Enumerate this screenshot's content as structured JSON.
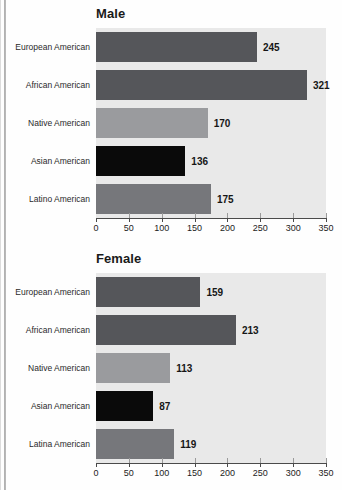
{
  "colors": {
    "dark_gray": "#55565a",
    "medium_gray": "#76777b",
    "light_gray": "#9a9b9e",
    "black": "#0a0a0a",
    "plot_background": "#e9e9e9",
    "axis": "#4a4a4a"
  },
  "chart_data": [
    {
      "type": "bar",
      "orientation": "horizontal",
      "title": "Male",
      "xlabel": "",
      "ylabel": "",
      "xlim": [
        0,
        350
      ],
      "xticks": [
        0,
        50,
        100,
        150,
        200,
        250,
        300,
        350
      ],
      "grid": false,
      "legend": "none",
      "categories": [
        "European American",
        "African American",
        "Native American",
        "Asian American",
        "Latino American"
      ],
      "values": [
        245,
        321,
        170,
        136,
        175
      ],
      "bar_colors": [
        "#55565a",
        "#55565a",
        "#9a9b9e",
        "#0a0a0a",
        "#76777b"
      ]
    },
    {
      "type": "bar",
      "orientation": "horizontal",
      "title": "Female",
      "xlabel": "",
      "ylabel": "",
      "xlim": [
        0,
        350
      ],
      "xticks": [
        0,
        50,
        100,
        150,
        200,
        250,
        300,
        350
      ],
      "grid": false,
      "legend": "none",
      "categories": [
        "European American",
        "African American",
        "Native American",
        "Asian American",
        "Latina American"
      ],
      "values": [
        159,
        213,
        113,
        87,
        119
      ],
      "bar_colors": [
        "#55565a",
        "#55565a",
        "#9a9b9e",
        "#0a0a0a",
        "#76777b"
      ]
    }
  ]
}
